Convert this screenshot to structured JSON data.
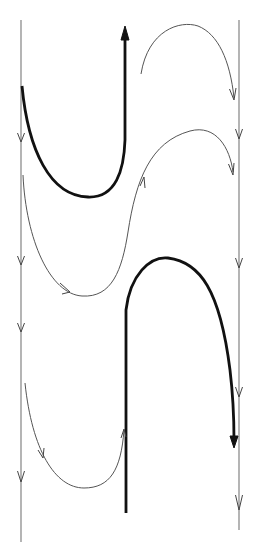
{
  "diagram": {
    "title": "",
    "colors": {
      "background": "#ffffff",
      "thin_line": "#555555",
      "thick_line": "#111111",
      "guide_line": "#777777"
    },
    "guides": [
      {
        "name": "left-guide",
        "x": 21,
        "y1": 20,
        "y2": 542,
        "direction": "down",
        "arrow_ys": [
          140,
          265,
          392
        ]
      },
      {
        "name": "right-guide",
        "x": 239,
        "y1": 20,
        "y2": 528,
        "direction": "down",
        "arrow_ys": [
          135,
          265,
          500
        ]
      }
    ],
    "curves": [
      {
        "name": "thick-u-top",
        "weight": "thick",
        "direction": "up"
      },
      {
        "name": "thin-arc-top",
        "weight": "thin",
        "direction": "down"
      },
      {
        "name": "thin-s-middle",
        "weight": "thin",
        "direction": "right"
      },
      {
        "name": "thick-n-bottom",
        "weight": "thick",
        "direction": "down"
      },
      {
        "name": "thin-u-bottom",
        "weight": "thin",
        "direction": "up"
      }
    ]
  }
}
